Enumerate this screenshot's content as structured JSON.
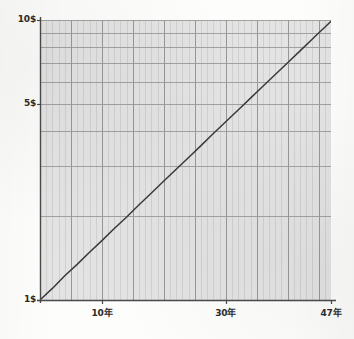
{
  "chart_data": {
    "type": "line",
    "title": "",
    "subtitle": "",
    "xlabel": "",
    "ylabel": "",
    "yscale": "log",
    "xscale": "linear",
    "grid": true,
    "legend": null,
    "xlim": [
      0,
      47
    ],
    "ylim": [
      1,
      10
    ],
    "y_ticks": [
      1,
      2,
      3,
      4,
      5,
      6,
      7,
      8,
      9,
      10
    ],
    "y_tick_labels_shown": [
      "1$",
      "5$",
      "10$"
    ],
    "x_ticks": [
      10,
      30,
      47
    ],
    "x_tick_labels": [
      "10年",
      "30年",
      "47年"
    ],
    "annotations": [],
    "series": [
      {
        "name": "compound-growth",
        "x": [
          0,
          2,
          4,
          6,
          8,
          10,
          12,
          14,
          16,
          18,
          20,
          22,
          24,
          26,
          28,
          30,
          32,
          34,
          36,
          38,
          40,
          42,
          44,
          45,
          46,
          47
        ],
        "y": [
          1.0,
          1.1,
          1.22,
          1.34,
          1.48,
          1.63,
          1.8,
          1.98,
          2.19,
          2.41,
          2.66,
          2.93,
          3.23,
          3.56,
          3.93,
          4.33,
          4.77,
          5.26,
          5.8,
          6.39,
          7.04,
          7.76,
          8.55,
          8.98,
          9.42,
          9.9
        ]
      }
    ]
  },
  "axis": {
    "y_top_label": "10$",
    "y_mid_label": "5$",
    "y_bottom_label": "1$",
    "x_label_1": "10年",
    "x_label_2": "30年",
    "x_label_3": "47年"
  },
  "colors": {
    "plot_background": "#e2e2e2",
    "minor_gridline": "#c8c8c8",
    "major_gridline": "#8e8e8e",
    "horizontal_gridline": "#9a9a9a",
    "axis_line": "#4a4a4a",
    "curve": "#3a3a3a",
    "label_text": "#2a2a2a",
    "page_background": "#fdfdfc"
  }
}
